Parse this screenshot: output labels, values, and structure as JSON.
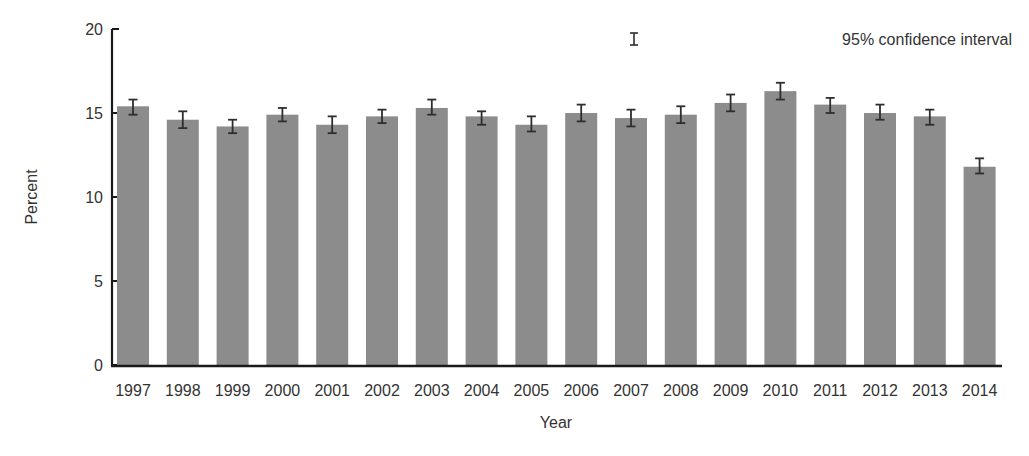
{
  "chart_data": {
    "type": "bar",
    "title": "",
    "xlabel": "Year",
    "ylabel": "Percent",
    "ylim": [
      0,
      20
    ],
    "yticks": [
      0,
      5,
      10,
      15,
      20
    ],
    "grid": false,
    "legend": {
      "position": "top-right",
      "entries": [
        "95% confidence interval"
      ]
    },
    "categories": [
      "1997",
      "1998",
      "1999",
      "2000",
      "2001",
      "2002",
      "2003",
      "2004",
      "2005",
      "2006",
      "2007",
      "2008",
      "2009",
      "2010",
      "2011",
      "2012",
      "2013",
      "2014"
    ],
    "values": [
      15.4,
      14.6,
      14.2,
      14.9,
      14.3,
      14.8,
      15.3,
      14.8,
      14.3,
      15.0,
      14.7,
      14.9,
      15.6,
      16.3,
      15.5,
      15.0,
      14.8,
      11.8
    ],
    "ci_lower": [
      14.9,
      14.1,
      13.8,
      14.5,
      13.8,
      14.4,
      14.9,
      14.3,
      13.9,
      14.5,
      14.2,
      14.4,
      15.1,
      15.8,
      15.0,
      14.6,
      14.3,
      11.4
    ],
    "ci_upper": [
      15.8,
      15.1,
      14.6,
      15.3,
      14.8,
      15.2,
      15.8,
      15.1,
      14.8,
      15.5,
      15.2,
      15.4,
      16.1,
      16.8,
      15.9,
      15.5,
      15.2,
      12.3
    ],
    "colors": {
      "bar": "#8c8c8c",
      "error_bar": "#2e2e2e",
      "axis": "#1a1a1a",
      "text": "#333333"
    }
  }
}
